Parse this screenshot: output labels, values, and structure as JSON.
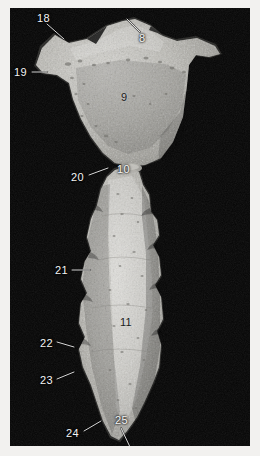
{
  "plate": {
    "kind": "anatomical-specimen-photograph",
    "background_color": "#050505",
    "border_color": "#f2f1ef",
    "specimen_color": "#b9b8b4",
    "caption": ""
  },
  "specimens": [
    {
      "name": "upper-bone-fragment",
      "description": "broad triangular bone with two superior horn-like processes and a lateral wing"
    },
    {
      "name": "lower-bone-fragment",
      "description": "elongate columnar bone with scalloped lateral margins"
    }
  ],
  "annotations": [
    {
      "id": "label-18",
      "text": "18",
      "tone": "light",
      "x": 37,
      "y": 13
    },
    {
      "id": "label-8",
      "text": "8",
      "tone": "light",
      "x": 139,
      "y": 33
    },
    {
      "id": "label-19",
      "text": "19",
      "tone": "light",
      "x": 14,
      "y": 67
    },
    {
      "id": "label-9",
      "text": "9",
      "tone": "dark",
      "x": 121,
      "y": 92
    },
    {
      "id": "label-20",
      "text": "20",
      "tone": "light",
      "x": 71,
      "y": 172
    },
    {
      "id": "label-10",
      "text": "10",
      "tone": "light",
      "x": 117,
      "y": 164
    },
    {
      "id": "label-21",
      "text": "21",
      "tone": "light",
      "x": 55,
      "y": 265
    },
    {
      "id": "label-11",
      "text": "11",
      "tone": "dark",
      "x": 120,
      "y": 317
    },
    {
      "id": "label-22",
      "text": "22",
      "tone": "light",
      "x": 40,
      "y": 338
    },
    {
      "id": "label-23",
      "text": "23",
      "tone": "light",
      "x": 40,
      "y": 375
    },
    {
      "id": "label-24",
      "text": "24",
      "tone": "light",
      "x": 66,
      "y": 428
    },
    {
      "id": "label-25",
      "text": "25",
      "tone": "light",
      "x": 115,
      "y": 415
    }
  ],
  "leaders": [
    {
      "id": "leader-18",
      "x1": 47,
      "y1": 24,
      "x2": 64,
      "y2": 39
    },
    {
      "id": "leader-8",
      "x1": 140,
      "y1": 32,
      "x2": 127,
      "y2": 19
    },
    {
      "id": "leader-19",
      "x1": 32,
      "y1": 72,
      "x2": 47,
      "y2": 72
    },
    {
      "id": "leader-20",
      "x1": 89,
      "y1": 175,
      "x2": 108,
      "y2": 168
    },
    {
      "id": "leader-21",
      "x1": 72,
      "y1": 270,
      "x2": 90,
      "y2": 270
    },
    {
      "id": "leader-22",
      "x1": 57,
      "y1": 342,
      "x2": 74,
      "y2": 347
    },
    {
      "id": "leader-23",
      "x1": 57,
      "y1": 379,
      "x2": 74,
      "y2": 372
    },
    {
      "id": "leader-24",
      "x1": 84,
      "y1": 431,
      "x2": 101,
      "y2": 421
    },
    {
      "id": "leader-25",
      "x1": 121,
      "y1": 428,
      "x2": 130,
      "y2": 447
    }
  ]
}
